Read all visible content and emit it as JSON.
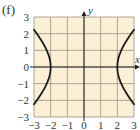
{
  "panel_label": "(f)",
  "chart_data": {
    "type": "line",
    "title": "",
    "xlabel": "x",
    "ylabel": "y",
    "xlim": [
      -3,
      3
    ],
    "ylim": [
      -3,
      3
    ],
    "grid": true,
    "legend": null,
    "x_ticks": [
      -3,
      -2,
      -1,
      0,
      1,
      2,
      3
    ],
    "y_ticks": [
      -3,
      -2,
      -1,
      0,
      1,
      2,
      3
    ],
    "x_tick_labels": [
      "−3",
      "−2",
      "−1",
      "0",
      "1",
      "2",
      "3"
    ],
    "y_tick_labels": [
      "−3",
      "−2",
      "−1",
      "0",
      "1",
      "2",
      "3"
    ],
    "annotation": "Hyperbola x² − y² = 4 (vertices at (±2, 0))",
    "series": [
      {
        "name": "left branch",
        "x": [
          -3.0,
          -2.828,
          -2.646,
          -2.449,
          -2.236,
          -2.0,
          -2.236,
          -2.449,
          -2.646,
          -2.828,
          -3.0
        ],
        "y": [
          2.236,
          2.0,
          1.732,
          1.414,
          1.0,
          0.0,
          -1.0,
          -1.414,
          -1.732,
          -2.0,
          -2.236
        ]
      },
      {
        "name": "right branch",
        "x": [
          3.0,
          2.828,
          2.646,
          2.449,
          2.236,
          2.0,
          2.236,
          2.449,
          2.646,
          2.828,
          3.0
        ],
        "y": [
          2.236,
          2.0,
          1.732,
          1.414,
          1.0,
          0.0,
          -1.0,
          -1.414,
          -1.732,
          -2.0,
          -2.236
        ]
      }
    ],
    "colors": {
      "background": "#fbefd6",
      "grid": "#9a9080",
      "axis": "#222222",
      "curve": "#1a1a1a",
      "tick_text": "#333333"
    }
  }
}
